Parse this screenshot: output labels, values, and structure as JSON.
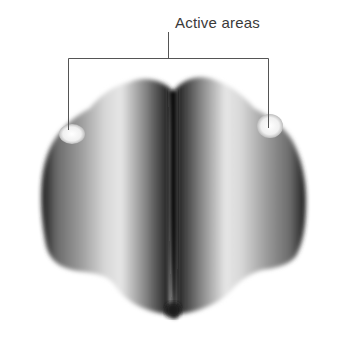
{
  "figure": {
    "annotation_label": "Active areas",
    "colors": {
      "background": "#ffffff",
      "line": "#555555",
      "brain_dark": "#111111",
      "brain_light": "#e8e8e8",
      "active_spot": "#f4f4f4"
    }
  }
}
